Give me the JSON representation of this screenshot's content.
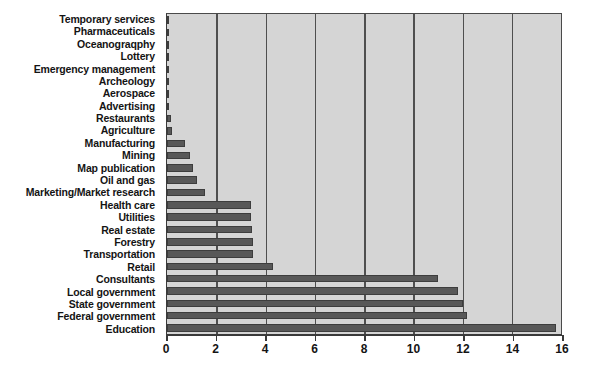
{
  "chart_data": {
    "type": "bar",
    "orientation": "horizontal",
    "title": "",
    "subtitle": "",
    "xlabel": "",
    "ylabel": "",
    "xlim": [
      0,
      16
    ],
    "xticks": [
      0,
      2,
      4,
      6,
      8,
      10,
      12,
      14,
      16
    ],
    "xtick_labels": [
      "0",
      "2",
      "4",
      "6",
      "8",
      "10",
      "12",
      "14",
      "16"
    ],
    "grid": true,
    "grid_axis": "x",
    "legend": null,
    "categories": [
      "Temporary services",
      "Pharmaceuticals",
      "Oceanograqphy",
      "Lottery",
      "Emergency management",
      "Archeology",
      "Aerospace",
      "Advertising",
      "Restaurants",
      "Agriculture",
      "Manufacturing",
      "Mining",
      "Map publication",
      "Oil and gas",
      "Marketing/Market research",
      "Health care",
      "Utilities",
      "Real estate",
      "Forestry",
      "Transportation",
      "Retail",
      "Consultants",
      "Local government",
      "State government",
      "Federal government",
      "Education"
    ],
    "values": [
      0.1,
      0.1,
      0.1,
      0.1,
      0.1,
      0.1,
      0.1,
      0.1,
      0.15,
      0.2,
      0.75,
      0.95,
      1.05,
      1.2,
      1.55,
      3.4,
      3.4,
      3.45,
      3.5,
      3.5,
      4.3,
      11.0,
      11.8,
      12.0,
      12.2,
      15.8
    ]
  },
  "style": {
    "plot_background": "#d5d5d5",
    "page_background": "#ffffff",
    "bar_color": "#585858",
    "gridline_color": "#4f4f4f",
    "axis_color": "#3a3a3a",
    "label_color": "#141414"
  }
}
